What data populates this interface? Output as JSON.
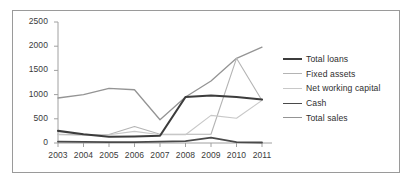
{
  "chart_data": {
    "type": "line",
    "title": "",
    "subtitle": "",
    "xlabel": "",
    "ylabel": "",
    "categories": [
      "2003",
      "2004",
      "2005",
      "2006",
      "2007",
      "2008",
      "2009",
      "2010",
      "2011"
    ],
    "x": [
      2003,
      2004,
      2005,
      2006,
      2007,
      2008,
      2009,
      2010,
      2011
    ],
    "ylim": [
      0,
      2500
    ],
    "yticks": [
      0,
      500,
      1000,
      1500,
      2000,
      2500
    ],
    "ytick_labels": [
      "0",
      "500",
      "1000",
      "1500",
      "2000",
      "2500"
    ],
    "grid": false,
    "legend_position": "right",
    "series": [
      {
        "name": "Total loans",
        "color": "#3c3c3c",
        "line_width": 2.1,
        "values": [
          250,
          180,
          130,
          135,
          150,
          950,
          980,
          950,
          900
        ]
      },
      {
        "name": "Fixed assets",
        "color": "#b4b4b4",
        "line_width": 1.1,
        "values": [
          180,
          170,
          175,
          340,
          180,
          180,
          180,
          1750,
          880
        ]
      },
      {
        "name": "Net working capital",
        "color": "#c8c8c8",
        "line_width": 1.1,
        "values": [
          170,
          160,
          170,
          240,
          170,
          170,
          570,
          510,
          880
        ]
      },
      {
        "name": "Cash",
        "color": "#4a4a4a",
        "line_width": 1.8,
        "values": [
          30,
          25,
          20,
          20,
          30,
          40,
          110,
          20,
          10
        ]
      },
      {
        "name": "Total sales",
        "color": "#949494",
        "line_width": 1.3,
        "values": [
          930,
          1000,
          1130,
          1100,
          480,
          950,
          1280,
          1750,
          1980
        ]
      }
    ]
  },
  "axes": {
    "axis_color": "#a0a0a0",
    "tick_color": "#a0a0a0",
    "label_color": "#3a3a3a"
  },
  "frame": {
    "border_color": "#9a9a9a"
  }
}
